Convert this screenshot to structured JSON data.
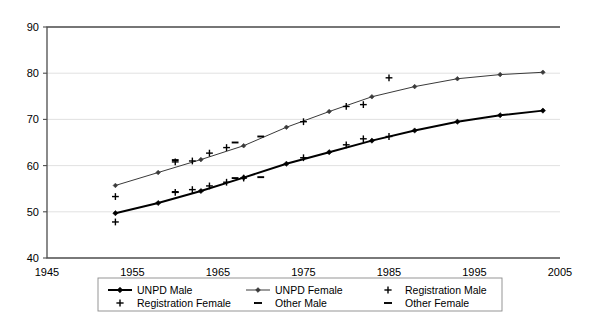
{
  "chart_data": {
    "type": "line",
    "title": "",
    "subtitle": "",
    "xlabel": "",
    "ylabel": "",
    "xlim": [
      1945,
      2005
    ],
    "ylim": [
      40,
      90
    ],
    "xticks": [
      1945,
      1955,
      1965,
      1975,
      1985,
      1995,
      2005
    ],
    "yticks": [
      40,
      50,
      60,
      70,
      80,
      90
    ],
    "grid": "horizontal",
    "legend_position": "bottom",
    "series": [
      {
        "name": "UNPD Male",
        "marker": "diamond",
        "line": "solid-thick",
        "color": "#000000",
        "x": [
          1953,
          1958,
          1963,
          1968,
          1973,
          1978,
          1983,
          1988,
          1993,
          1998,
          2003
        ],
        "values": [
          49.7,
          51.9,
          54.5,
          57.4,
          60.4,
          62.9,
          65.4,
          67.6,
          69.5,
          70.9,
          71.9
        ]
      },
      {
        "name": "UNPD Female",
        "marker": "diamond",
        "line": "solid-thin",
        "color": "#3a3a3a",
        "x": [
          1953,
          1958,
          1963,
          1968,
          1973,
          1978,
          1983,
          1988,
          1993,
          1998,
          2003
        ],
        "values": [
          55.7,
          58.5,
          61.3,
          64.3,
          68.3,
          71.7,
          74.9,
          77.1,
          78.8,
          79.7,
          80.2
        ]
      },
      {
        "name": "Registration Male",
        "marker": "plus",
        "line": "none",
        "color": "#000000",
        "x": [
          1953,
          1960,
          1962,
          1964,
          1966,
          1968,
          1975,
          1980,
          1982,
          1985
        ],
        "values": [
          47.8,
          54.2,
          54.8,
          55.6,
          56.4,
          57.3,
          61.7,
          64.5,
          65.8,
          66.3
        ]
      },
      {
        "name": "Registration Female",
        "marker": "plus",
        "line": "none",
        "color": "#000000",
        "x": [
          1953,
          1960,
          1962,
          1964,
          1966,
          1975,
          1980,
          1982,
          1985
        ],
        "values": [
          53.3,
          60.8,
          61.0,
          62.7,
          63.9,
          69.5,
          72.8,
          73.2,
          79.0
        ]
      },
      {
        "name": "Other Male",
        "marker": "dash",
        "line": "none",
        "color": "#000000",
        "x": [
          1960,
          1967,
          1970
        ],
        "values": [
          54.3,
          57.3,
          57.5
        ]
      },
      {
        "name": "Other Female",
        "marker": "dash",
        "line": "none",
        "color": "#000000",
        "x": [
          1960,
          1967,
          1970
        ],
        "values": [
          61.2,
          65.0,
          66.3
        ]
      }
    ]
  },
  "axes": {
    "x_tick_labels": [
      "1945",
      "1955",
      "1965",
      "1975",
      "1985",
      "1995",
      "2005"
    ],
    "y_tick_labels": [
      "40",
      "50",
      "60",
      "70",
      "80",
      "90"
    ]
  },
  "legend": {
    "items": [
      {
        "label": "UNPD Male",
        "marker": "line-diamond-thick"
      },
      {
        "label": "UNPD Female",
        "marker": "line-diamond-thin"
      },
      {
        "label": "Registration Male",
        "marker": "plus"
      },
      {
        "label": "Registration Female",
        "marker": "plus"
      },
      {
        "label": "Other Male",
        "marker": "dash"
      },
      {
        "label": "Other Female",
        "marker": "dash"
      }
    ]
  }
}
